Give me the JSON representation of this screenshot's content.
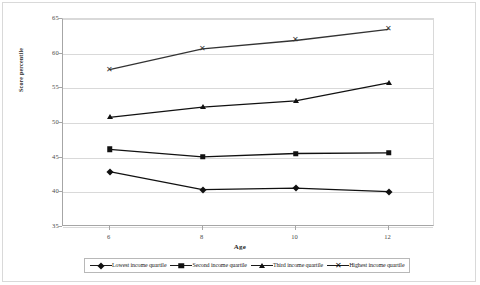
{
  "chart_data": {
    "type": "line",
    "title": "",
    "xlabel": "Age",
    "ylabel": "Score percentile",
    "x": [
      6,
      8,
      10,
      12
    ],
    "xticklabels": [
      "6",
      "8",
      "10",
      "12"
    ],
    "xlim": [
      5,
      13
    ],
    "ylim": [
      35,
      65
    ],
    "yticklabels": [
      "35",
      "40",
      "45",
      "50",
      "55",
      "60",
      "65"
    ],
    "yticks": [
      35,
      40,
      45,
      50,
      55,
      60,
      65
    ],
    "grid": "horizontal",
    "legend_position": "bottom",
    "series": [
      {
        "name": "Lowest income quartile",
        "marker": "diamond",
        "color": "#111111",
        "values": [
          43.0,
          40.4,
          40.6,
          40.1
        ]
      },
      {
        "name": "Second income quartile",
        "marker": "square",
        "color": "#111111",
        "values": [
          46.2,
          45.1,
          45.6,
          45.7
        ]
      },
      {
        "name": "Third income quartile",
        "marker": "triangle",
        "color": "#111111",
        "values": [
          50.8,
          52.3,
          53.2,
          55.8
        ]
      },
      {
        "name": "Highest income quartile",
        "marker": "cross",
        "color": "#333333",
        "values": [
          57.7,
          60.7,
          61.9,
          63.5
        ]
      }
    ]
  },
  "legend": {
    "entries": [
      {
        "label": "Lowest income quartile",
        "marker": "diamond"
      },
      {
        "label": "Second income quartile",
        "marker": "square"
      },
      {
        "label": "Third income quartile",
        "marker": "triangle"
      },
      {
        "label": "Highest income quartile",
        "marker": "cross"
      }
    ]
  },
  "axes": {
    "x_title": "Age",
    "y_title": "Score percentile"
  },
  "colors": {
    "line": "#1a1a1a",
    "gridline": "#d9d9d9",
    "axis": "#a6a6a6",
    "tick_text": "#4a4a4a",
    "background": "#ffffff"
  }
}
